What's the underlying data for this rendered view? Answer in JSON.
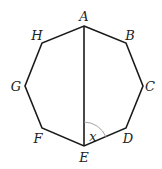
{
  "diagram": {
    "type": "regular-octagon",
    "stroke_color": "#1a1a1a",
    "arc_color": "#999999",
    "vertices": [
      {
        "name": "A",
        "x": 84,
        "y": 26,
        "lx": 84,
        "ly": 21
      },
      {
        "name": "B",
        "x": 126,
        "y": 43,
        "lx": 130,
        "ly": 40
      },
      {
        "name": "C",
        "x": 143,
        "y": 86,
        "lx": 150,
        "ly": 91
      },
      {
        "name": "D",
        "x": 126,
        "y": 128,
        "lx": 128,
        "ly": 143
      },
      {
        "name": "E",
        "x": 84,
        "y": 146,
        "lx": 84,
        "ly": 162
      },
      {
        "name": "F",
        "x": 42,
        "y": 128,
        "lx": 38,
        "ly": 143
      },
      {
        "name": "G",
        "x": 25,
        "y": 86,
        "lx": 16,
        "ly": 91
      },
      {
        "name": "H",
        "x": 42,
        "y": 43,
        "lx": 37,
        "ly": 40
      }
    ],
    "diagonal": {
      "from": "A",
      "to": "E"
    },
    "angle": {
      "label": "x",
      "vertex": "E",
      "between": [
        "A",
        "D"
      ],
      "label_x": 92,
      "label_y": 141
    }
  }
}
